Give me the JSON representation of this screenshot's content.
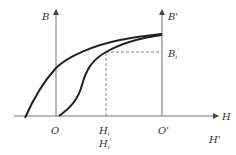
{
  "diagram": {
    "type": "magnetization-curves",
    "axes": {
      "left_vertical": {
        "label": "B"
      },
      "right_vertical": {
        "label": "B'"
      },
      "horizontal": {
        "label": "H"
      }
    },
    "labels": {
      "origin": "O",
      "origin_prime": "O'",
      "h_i": "H",
      "h_i_sub": "i",
      "h_i_prime": "H",
      "h_i_prime_sub": "i",
      "h_i_prime_mark": "'",
      "h_prime": "H'",
      "b_i_prime": "B",
      "b_i_prime_sub": "i",
      "b_i_prime_mark": "'"
    },
    "colors": {
      "axis": "#777777",
      "curve": "#222222",
      "dashed": "#666666",
      "text": "#333333"
    },
    "curves": [
      {
        "name": "hysteresis-upper-curve",
        "description": "starts below H axis left of O, passes B axis, saturates at O' axis"
      },
      {
        "name": "virgin-magnetization-curve",
        "description": "starts at O, S-shape, meets upper curve at saturation"
      }
    ]
  }
}
